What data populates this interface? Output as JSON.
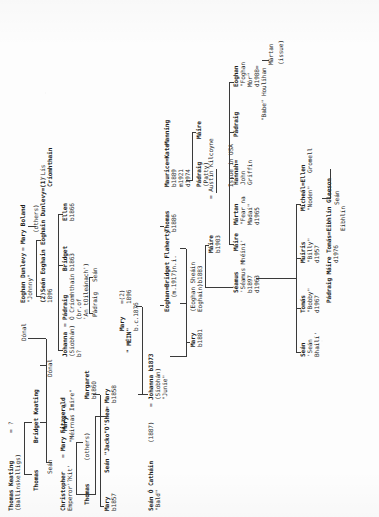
{
  "document": {
    "type": "genealogical-family-tree",
    "title": "Keating / Fitzgerald / O Cathain Family Tree",
    "orientation": "rotated-90-ccw",
    "medium": "typewritten photocopy",
    "ink_color": "#2b2b2b",
    "paper_color": "#fdfdfd"
  },
  "generations": {
    "g1": {
      "label": "generation-1",
      "people": [
        {
          "id": "thomas-keating",
          "name": "Thomas Keating",
          "detail": "(Ballinskelligs)",
          "spouse_marker": "=",
          "spouse": "?"
        },
        {
          "id": "christopher-fitzgerald",
          "name": "Christopher",
          "detail": "Emperor'?Kit'",
          "spouse_marker": "=",
          "spouse": "Mary Fitzgerald"
        }
      ]
    },
    "g2": {
      "label": "generation-2",
      "people": [
        {
          "id": "thomas-k2",
          "name": "Thomas"
        },
        {
          "id": "bridget-keating",
          "name": "Bridget Keating"
        },
        {
          "id": "thomas-f2",
          "name": "Thomas"
        },
        {
          "id": "others-f2",
          "name": "(others)"
        },
        {
          "id": "sean-g2",
          "name": "Seán"
        },
        {
          "id": "donal-a",
          "name": "Dónal"
        },
        {
          "id": "donal-b",
          "name": "Dónal"
        }
      ]
    },
    "g3": {
      "label": "generation-3",
      "people": [
        {
          "id": "mary-imire",
          "name": "Mary",
          "detail": "\"Méirnas Imire\"",
          "spouse_marker": "="
        },
        {
          "id": "margaret-b1860",
          "name": "Margaret",
          "detail": "b1860"
        },
        {
          "id": "mary-b1857",
          "name": "Mary",
          "detail": "b1857"
        },
        {
          "id": "sean-jacko-oshea",
          "name": "Seán \"Jacko\"O'Shea",
          "spouse_marker": "=",
          "spouse": "Mary",
          "spouse_detail": "b1858"
        },
        {
          "id": "johanna-siobhan",
          "name": "Johanna",
          "detail": "(Siobhán)",
          "detail2": "b?",
          "spouse_marker": "="
        },
        {
          "id": "padraig-o-criomhthain",
          "name": "Pádraig",
          "detail": "Ó Críomhthain",
          "detail2": "(br.of",
          "detail3": "'An tOileánach')"
        },
        {
          "id": "bridget-b1863",
          "name": "Bridget",
          "detail": "b1863"
        },
        {
          "id": "ellen-b1866",
          "name": "Ellen",
          "detail": "b1866"
        },
        {
          "id": "padraig-g3",
          "name": "Pádraig"
        },
        {
          "id": "sean-g3",
          "name": "Seán"
        }
      ]
    },
    "g4": {
      "label": "generation-4",
      "people": [
        {
          "id": "sean-o-cathain",
          "name": "Seán Ó Catháin",
          "detail": "\"Bald\"",
          "marriage_year": "(1887)",
          "spouse_marker": "=",
          "spouse": "Johanna b1873",
          "spouse_detail": "(Siobhán)",
          "spouse_nick": "\"Junie\""
        },
        {
          "id": "mary-mein",
          "name": "Mary",
          "detail": "\" MÉIN\"",
          "detail2": "b.c.1876",
          "marriage_marker": "=(2)",
          "marriage_year": "1896"
        },
        {
          "id": "eoghan-dunlevy",
          "name": "Eoghan Dunlevy",
          "spouse_marker": "=",
          "spouse": "Mary Boland",
          "nick": "\"Johnny\""
        },
        {
          "id": "sean-eoghain",
          "name": "(2)Seán Eoghain",
          "detail": "1896"
        },
        {
          "id": "others-g4",
          "name": "(others)"
        },
        {
          "id": "eoghain-dunlevy-1",
          "name": "Eoghain Dunlevy=(1)",
          "detail": "'Lís",
          "detail2": "Críomhthain"
        }
      ]
    },
    "g5": {
      "label": "generation-5",
      "people": [
        {
          "id": "mary-b1881",
          "name": "Mary",
          "detail": "b1881"
        },
        {
          "id": "eoghan-sheain",
          "name": "(Eoghan Sheáin",
          "detail": "Eoghain)b1883"
        },
        {
          "id": "eoghan-bridget-flaherty",
          "name": "Eoghan=Bridget Flaherty",
          "detail": "(m.1917)n.i."
        },
        {
          "id": "thomas-b1886",
          "name": "Thomas",
          "detail": "b1886"
        },
        {
          "id": "maurice-kate-manning",
          "name": "Maurice=Kate",
          "detail": "b1889",
          "detail2": "m1921",
          "detail3": "d1974",
          "spouse": "Manning"
        },
        {
          "id": "padraig-patty",
          "name": "Pádraig",
          "detail": "(Patty)"
        },
        {
          "id": "maire-g5",
          "name": "Máire"
        },
        {
          "id": "maire-b1903",
          "name": "Máire",
          "detail": "b1903"
        },
        {
          "id": "seamus-mheini",
          "name": "Séamus",
          "detail": "'Séamus Mhéiní'",
          "detail2": "b1897",
          "detail3": "d1963"
        },
        {
          "id": "austin-kilcoyne",
          "name": "= Austin Kilcoyne",
          "note": "Issue in USA"
        },
        {
          "id": "maire-martan",
          "name": "Máire",
          "spouse_marker": "=",
          "spouse": "Mártan",
          "spouse_detail": "\"Fear na",
          "spouse_detail2": "Madaí\"",
          "spouse_detail3": "d1965"
        },
        {
          "id": "hannah-john-griffin",
          "name": "Hannah=",
          "detail": "John",
          "detail2": "Griffin"
        },
        {
          "id": "padraig-g5",
          "name": "Pádraig"
        },
        {
          "id": "eoghan-babe-houlihan",
          "name": "Eoghan",
          "detail": "\"Foghan",
          "detail2": "Mór\"",
          "detail3": "d1988=",
          "spouse": "\"Babe\" Houlihan"
        },
        {
          "id": "martan-issue",
          "name": "Mártan",
          "detail": "(issue)"
        }
      ]
    },
    "g6": {
      "label": "generation-6",
      "people": [
        {
          "id": "sean-sean-bhaili",
          "name": "Seán",
          "detail": "'Seán",
          "detail2": "Bhailí'"
        },
        {
          "id": "tomas-bobby",
          "name": "Tomás",
          "detail": "\"Bobby\"",
          "detail2": "d1967"
        },
        {
          "id": "muiris-billy",
          "name": "Muiris",
          "detail": "\"Billy\"",
          "detail2": "d1957"
        },
        {
          "id": "michael-ellen-gromell",
          "name": "Micheál=Ellen",
          "detail": "\"Noden\"",
          "spouse": "Gromell"
        },
        {
          "id": "sean-g6",
          "name": "Seán"
        },
        {
          "id": "padraig-maire-toms",
          "name": "Pádraig Máire Tomás=Eibhlín Gleeson",
          "detail": "d1976",
          "detail2": "Eibhlín"
        }
      ]
    }
  },
  "annotations": {
    "issue_in_usa": "Issue in USA",
    "issue": "(issue)",
    "others": "(others)",
    "unknown": "?",
    "equals_marker": "=",
    "no_issue": "n.i."
  }
}
